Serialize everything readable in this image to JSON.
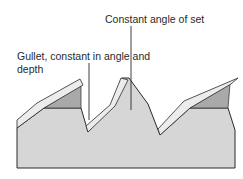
{
  "diagram": {
    "labels": {
      "set_angle": "Constant angle of set",
      "gullet_line1": "Gullet, constant in angle and",
      "gullet_line2": "depth"
    },
    "colors": {
      "body": "#d6d6d6",
      "set_face": "#e8e8e8",
      "shadow_face": "#a9a9a9",
      "outline": "#2a2a2a",
      "text": "#2a2a2a"
    }
  }
}
